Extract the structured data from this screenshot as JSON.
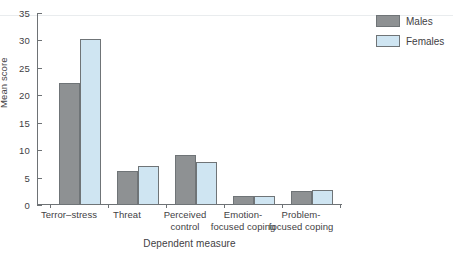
{
  "chart_data": {
    "type": "bar",
    "title": "",
    "xlabel": "Dependent measure",
    "ylabel": "Mean score",
    "ylim": [
      0,
      35
    ],
    "yticks": [
      0,
      5,
      10,
      15,
      20,
      25,
      30,
      35
    ],
    "grid": false,
    "legend_position": "top-right",
    "categories": [
      "Terror–stress",
      "Threat",
      "Perceived\ncontrol",
      "Emotion-\nfocused coping",
      "Problem-\nfocused coping"
    ],
    "series": [
      {
        "name": "Males",
        "color": "#8e9193",
        "values": [
          22.3,
          6.2,
          9.2,
          1.6,
          2.6
        ]
      },
      {
        "name": "Females",
        "color": "#cfe5f2",
        "values": [
          30.3,
          7.1,
          7.8,
          1.7,
          2.8
        ]
      }
    ]
  },
  "axes": {
    "y_tick_labels": [
      "0",
      "5",
      "10",
      "15",
      "20",
      "25",
      "30",
      "35"
    ],
    "y_title": "Mean score",
    "x_title": "Dependent measure"
  },
  "categories_display": [
    {
      "line1": "Terror–stress",
      "line2": ""
    },
    {
      "line1": "Threat",
      "line2": ""
    },
    {
      "line1": "Perceived",
      "line2": "control"
    },
    {
      "line1": "Emotion-",
      "line2": "focused coping"
    },
    {
      "line1": "Problem-",
      "line2": "focused coping"
    }
  ],
  "legend": {
    "items": [
      {
        "label": "Males",
        "color": "#8e9193"
      },
      {
        "label": "Females",
        "color": "#cfe5f2"
      }
    ]
  }
}
